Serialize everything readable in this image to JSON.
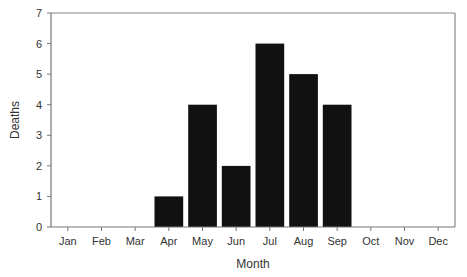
{
  "chart_data": {
    "type": "bar",
    "title": "",
    "xlabel": "Month",
    "ylabel": "Deaths",
    "categories": [
      "Jan",
      "Feb",
      "Mar",
      "Apr",
      "May",
      "Jun",
      "Jul",
      "Aug",
      "Sep",
      "Oct",
      "Nov",
      "Dec"
    ],
    "values": [
      0,
      0,
      0,
      1,
      4,
      2,
      6,
      5,
      4,
      0,
      0,
      0
    ],
    "ylim": [
      0,
      7
    ],
    "yticks": [
      0,
      1,
      2,
      3,
      4,
      5,
      6,
      7
    ],
    "grid": false,
    "legend": null,
    "colors": {
      "bar": "#111111",
      "axis": "#777777",
      "text": "#333333"
    }
  }
}
